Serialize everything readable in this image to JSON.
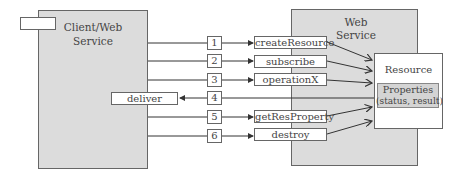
{
  "client": {
    "title_line1": "Client/Web",
    "title_line2": "Service",
    "deliver_label": "deliver"
  },
  "web_service": {
    "title_line1": "Web",
    "title_line2": "Service"
  },
  "resource": {
    "title": "Resource",
    "properties_line1": "Properties",
    "properties_line2": "(status, result)"
  },
  "steps": [
    {
      "number": "1",
      "method": "createResource",
      "direction": "to-service"
    },
    {
      "number": "2",
      "method": "subscribe",
      "direction": "to-service"
    },
    {
      "number": "3",
      "method": "operationX",
      "direction": "to-service"
    },
    {
      "number": "4",
      "method": "deliver",
      "direction": "to-client"
    },
    {
      "number": "5",
      "method": "getResProperty",
      "direction": "to-service"
    },
    {
      "number": "6",
      "method": "destroy",
      "direction": "to-service"
    }
  ],
  "colors": {
    "box_fill": "#dcdcdc",
    "border": "#666666",
    "line": "#333333"
  }
}
